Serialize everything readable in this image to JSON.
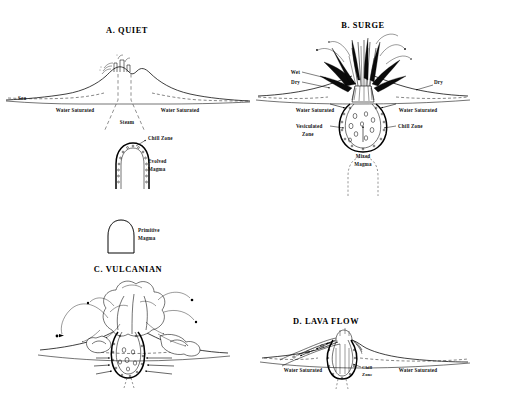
{
  "figure": {
    "background_color": "#ffffff",
    "ink_color": "#000000"
  },
  "panels": [
    {
      "id": "A",
      "title": "A. QUIET",
      "labels": {
        "sea": "Sea",
        "water_saturated_left": "Water Saturated",
        "water_saturated_right": "Water Saturated",
        "steam": "Steam",
        "chill_zone": "Chill Zone",
        "evolved_magma": "Evolved Magma"
      }
    },
    {
      "id": "B",
      "title": "B. SURGE",
      "labels": {
        "wet": "Wet",
        "dry_left": "Dry",
        "dry_right": "Dry",
        "water_saturated_left": "Water Saturated",
        "water_saturated_right": "Water Saturated",
        "vesiculated_zone": "Vesiculated Zone",
        "chill_zone": "Chill Zone",
        "mixed_magma": "Mixed Magma"
      }
    },
    {
      "id": "C",
      "title": "C. VULCANIAN",
      "labels": {}
    },
    {
      "id": "D",
      "title": "D. LAVA FLOW",
      "labels": {
        "water_saturated_left": "Water Saturated",
        "water_saturated_right": "Water Saturated",
        "chill_zone": "Chill Zone"
      }
    }
  ],
  "legend": {
    "primitive_magma": "Primitive Magma"
  }
}
